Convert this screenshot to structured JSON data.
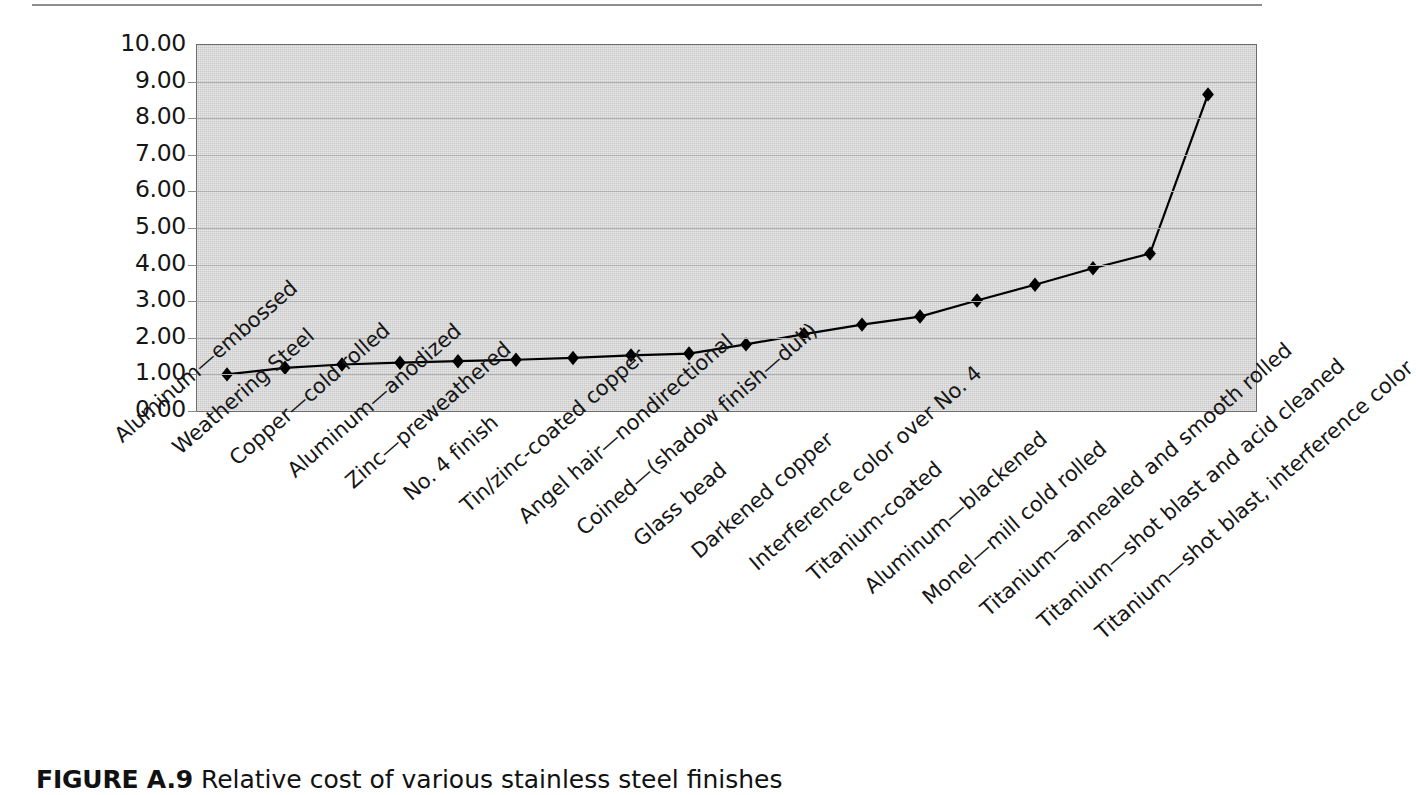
{
  "figure": {
    "caption_label": "FIGURE A.9",
    "caption_text": "Relative cost of various stainless steel finishes"
  },
  "colors": {
    "plot_background": "#c9c9c9",
    "plot_border": "#6d6d6d",
    "gridline": "#b0b0b0",
    "series_line": "#000000",
    "marker": "#000000",
    "page_background": "#ffffff",
    "rule": "#8d8d8d",
    "text": "#151515"
  },
  "chart_data": {
    "type": "line",
    "title": "Relative cost of various stainless steel finishes",
    "xlabel": "",
    "ylabel": "",
    "ylim": [
      0,
      10
    ],
    "ytick_step": 1,
    "grid": true,
    "legend": false,
    "marker": "diamond",
    "ytick_labels": [
      "10.00",
      "9.00",
      "8.00",
      "7.00",
      "6.00",
      "5.00",
      "4.00",
      "3.00",
      "2.00",
      "1.00",
      "0.00"
    ],
    "categories": [
      "Aluminum—embossed",
      "Weathering Steel",
      "Copper—cold rolled",
      "Aluminum—anodized",
      "Zinc—preweathered",
      "No. 4 finish",
      "Tin/zinc-coated copper",
      "Angel hair—nondirectional",
      "Coined—(shadow finish—dull)",
      "Glass bead",
      "Darkened copper",
      "Interference color over No. 4",
      "Titanium-coated",
      "Aluminum—blackened",
      "Monel—mill cold rolled",
      "Titanium—annealed and smooth rolled",
      "Titanium—shot blast and acid cleaned",
      "Titanium—shot blast, interference color"
    ],
    "values": [
      1.0,
      1.18,
      1.27,
      1.32,
      1.36,
      1.4,
      1.45,
      1.52,
      1.57,
      1.82,
      2.1,
      2.36,
      2.58,
      3.02,
      3.45,
      3.9,
      4.3,
      8.65
    ]
  }
}
